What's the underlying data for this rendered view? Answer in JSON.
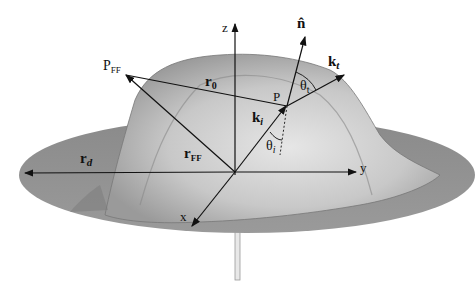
{
  "diagram": {
    "axes": {
      "z": "z",
      "y": "y",
      "x": "x"
    },
    "vectors": {
      "normal": "n̂",
      "k_t": "k",
      "k_t_sub": "t",
      "k_i": "k",
      "k_i_sub": "i",
      "r_0": "r",
      "r_0_sub": "0",
      "r_FF": "r",
      "r_FF_sub": "FF",
      "r_d": "r",
      "r_d_sub": "d"
    },
    "points": {
      "P": "P",
      "P_FF": "P",
      "P_FF_sub": "FF"
    },
    "angles": {
      "theta_t": "θ",
      "theta_t_sub": "t",
      "theta_i": "θ",
      "theta_i_sub": "i"
    },
    "colors": {
      "disk": "#8c8c8c",
      "surface_light": "#d8d8d8",
      "surface_mid": "#b4b4b4",
      "lines": "#111111"
    }
  }
}
